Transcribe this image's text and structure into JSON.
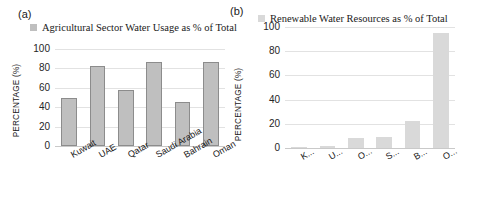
{
  "figure": {
    "panels": [
      {
        "letter": "(a)",
        "legend_label": "Agricultural Sector Water Usage as % of Total",
        "legend_color": "#bfbfbf"
      },
      {
        "letter": "(b)",
        "legend_label": "Renewable Water Resources as % of Total",
        "legend_color": "#d9d9d9"
      }
    ]
  },
  "chart_data": [
    {
      "type": "bar",
      "panel": "(a)",
      "title": "Agricultural Sector Water Usage as % of Total",
      "categories": [
        "Kuwait",
        "UAE",
        "Qatar",
        "Saudi Arabia",
        "Bahrain",
        "Oman"
      ],
      "values": [
        49,
        83,
        58,
        87,
        45,
        87
      ],
      "xlabel": "",
      "ylabel": "PERCENTAGE (%)",
      "ylim": [
        0,
        100
      ],
      "yticks": [
        0,
        20,
        40,
        60,
        80,
        100
      ],
      "ytick_labels": [
        "0",
        "20",
        "40",
        "60",
        "80",
        "100"
      ],
      "grid": true,
      "legend": [
        "Agricultural Sector Water Usage as % of Total"
      ],
      "legend_position": "top",
      "bar_color": "#bfbfbf",
      "bar_border_color": "#8c8c8c"
    },
    {
      "type": "bar",
      "panel": "(b)",
      "title": "Renewable Water Resources as % of Total",
      "categories": [
        "K...",
        "U...",
        "O...",
        "S...",
        "B...",
        "O..."
      ],
      "values": [
        1,
        2,
        8,
        9,
        22,
        95
      ],
      "xlabel": "",
      "ylabel": "PERCENTAGE (%)",
      "ylim": [
        0,
        100
      ],
      "yticks": [
        0,
        20,
        40,
        60,
        80,
        100
      ],
      "ytick_labels": [
        "0",
        "20",
        "40",
        "60",
        "80",
        "100"
      ],
      "grid": true,
      "legend": [
        "Renewable Water Resources as % of Total"
      ],
      "legend_position": "top",
      "bar_color": "#d9d9d9",
      "bar_border_color": "#d9d9d9"
    }
  ]
}
